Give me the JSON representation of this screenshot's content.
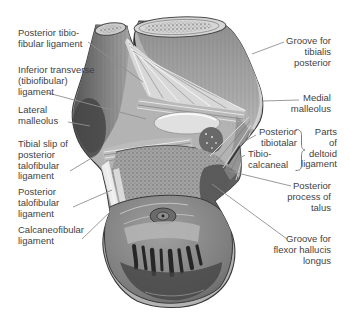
{
  "page": {
    "background": "#ffffff"
  },
  "colors": {
    "label_text": "#3f3f3f",
    "leader_line": "#8f8f8f",
    "figure_outline": "#3a3a3a",
    "bone_mid": "#b3b3b3",
    "bone_dark": "#4a4a4a",
    "ligament_light": "#e0e0e0"
  },
  "labels_left": [
    {
      "id": "posterior-tibiofibular-ligament",
      "text": "Posterior tibio-\nfibular ligament"
    },
    {
      "id": "inferior-transverse-tibiofibular-ligament",
      "text": "Inferior transverse\n(tibiofibular)\nligament"
    },
    {
      "id": "lateral-malleolus",
      "text": "Lateral\nmalleolus"
    },
    {
      "id": "tibial-slip-of-posterior-talofibular-ligament",
      "text": "Tibial slip of\nposterior\ntalofibular\nligament"
    },
    {
      "id": "posterior-talofibular-ligament",
      "text": "Posterior\ntalofibular\nligament"
    },
    {
      "id": "calcaneofibular-ligament",
      "text": "Calcaneofibular\nligament"
    }
  ],
  "labels_right": [
    {
      "id": "groove-for-tibialis-posterior",
      "text": "Groove for\ntibialis\nposterior"
    },
    {
      "id": "medial-malleolus",
      "text": "Medial\nmalleolus"
    },
    {
      "id": "posterior-tibiotalar",
      "text": "Posterior\ntibiotalar"
    },
    {
      "id": "tibiocalcaneal",
      "text": "Tibio-\ncalcaneal"
    },
    {
      "id": "parts-of-deltoid-ligament",
      "text": "Parts\nof\ndeltoid\nligament"
    },
    {
      "id": "posterior-process-of-talus",
      "text": "Posterior\nprocess of\ntalus"
    },
    {
      "id": "groove-for-flexor-hallucis-longus",
      "text": "Groove for\nflexor hallucis\nlongus"
    }
  ]
}
